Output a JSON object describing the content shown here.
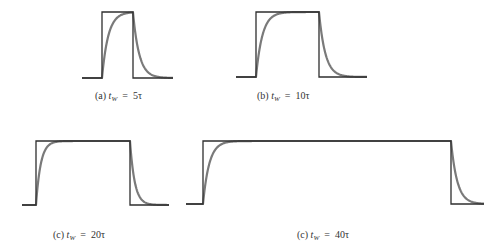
{
  "figure": {
    "colors": {
      "pulse": "#2f2f2f",
      "response": "#7a7a7a",
      "background": "#ffffff"
    },
    "panels": [
      {
        "id": "a",
        "label_prefix": "(a)",
        "label_var": "t",
        "label_sub": "W",
        "label_eq": "=",
        "label_value": "5τ",
        "width_over_tau": 5,
        "geometry": {
          "x_start": 82,
          "x_rise": 102,
          "x_fall": 133,
          "x_end": 173,
          "y_base": 78,
          "y_top": 12
        },
        "label_pos": {
          "x": 95,
          "y": 90
        }
      },
      {
        "id": "b",
        "label_prefix": "(b)",
        "label_var": "t",
        "label_sub": "W",
        "label_eq": "=",
        "label_value": "10τ",
        "width_over_tau": 10,
        "geometry": {
          "x_start": 236,
          "x_rise": 256,
          "x_fall": 319,
          "x_end": 367,
          "y_base": 77,
          "y_top": 12
        },
        "label_pos": {
          "x": 257,
          "y": 90
        }
      },
      {
        "id": "c1",
        "label_prefix": "(c)",
        "label_var": "t",
        "label_sub": "W",
        "label_eq": "=",
        "label_value": "20τ",
        "width_over_tau": 20,
        "geometry": {
          "x_start": 22,
          "x_rise": 36,
          "x_fall": 130,
          "x_end": 169,
          "y_base": 205,
          "y_top": 141
        },
        "label_pos": {
          "x": 53,
          "y": 229
        }
      },
      {
        "id": "c2",
        "label_prefix": "(c)",
        "label_var": "t",
        "label_sub": "W",
        "label_eq": "=",
        "label_value": "40τ",
        "width_over_tau": 40,
        "geometry": {
          "x_start": 186,
          "x_rise": 203,
          "x_fall": 451,
          "x_end": 484,
          "y_base": 204,
          "y_top": 141
        },
        "label_pos": {
          "x": 297,
          "y": 229
        }
      }
    ]
  }
}
